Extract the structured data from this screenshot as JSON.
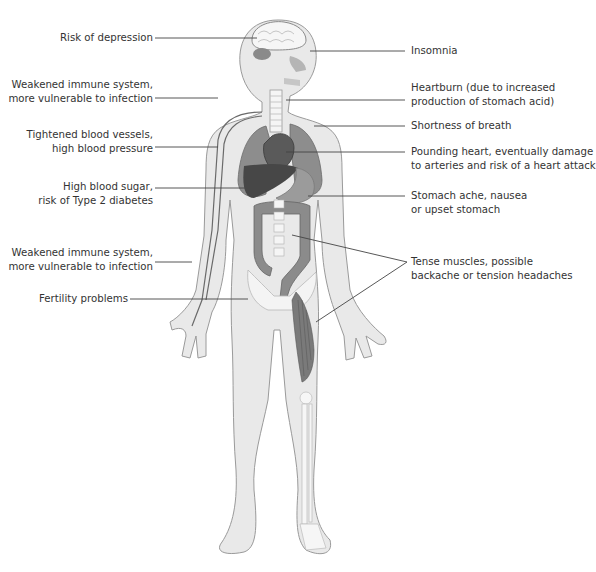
{
  "diagram": {
    "colors": {
      "skin_fill": "#e9e9e9",
      "skin_stroke": "#9a9a9a",
      "organ_mid": "#8c8c8c",
      "organ_dark": "#4e4e4e",
      "bone": "#f7f7f7",
      "leader_line": "#444444",
      "text": "#333333"
    },
    "labels_left": [
      {
        "id": "depression",
        "lines": [
          "Risk of depression"
        ],
        "target": "brain"
      },
      {
        "id": "immune-upper",
        "lines": [
          "Weakened immune system,",
          "more vulnerable to infection"
        ],
        "target": "neck/shoulder"
      },
      {
        "id": "blood-vessels",
        "lines": [
          "Tightened blood vessels,",
          "high blood pressure"
        ],
        "target": "arm blood vessels"
      },
      {
        "id": "blood-sugar",
        "lines": [
          "High blood sugar,",
          "risk of Type 2 diabetes"
        ],
        "target": "liver"
      },
      {
        "id": "immune-lower",
        "lines": [
          "Weakened immune system,",
          "more vulnerable to infection"
        ],
        "target": "forearm"
      },
      {
        "id": "fertility",
        "lines": [
          "Fertility problems"
        ],
        "target": "pelvis"
      }
    ],
    "labels_right": [
      {
        "id": "insomnia",
        "lines": [
          "Insomnia"
        ],
        "target": "eye"
      },
      {
        "id": "heartburn",
        "lines": [
          "Heartburn (due to increased",
          "production of stomach acid)"
        ],
        "target": "esophagus"
      },
      {
        "id": "breath",
        "lines": [
          "Shortness of breath"
        ],
        "target": "lungs"
      },
      {
        "id": "heart",
        "lines": [
          "Pounding heart, eventually damage",
          "to arteries and risk of a heart attack"
        ],
        "target": "heart"
      },
      {
        "id": "stomach",
        "lines": [
          "Stomach ache, nausea",
          "or upset stomach"
        ],
        "target": "stomach"
      },
      {
        "id": "muscles",
        "lines": [
          "Tense muscles, possible",
          "backache or tension headaches"
        ],
        "target": "spine and thigh muscles"
      }
    ]
  }
}
